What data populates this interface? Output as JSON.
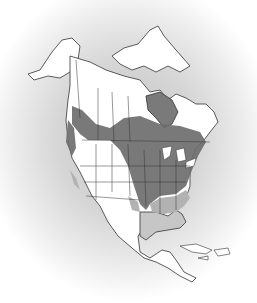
{
  "map": {
    "region": "North America",
    "style": "grayscale range map",
    "colors": {
      "background_halo": "#c8c8c8",
      "land": "#ffffff",
      "outline": "#333333",
      "range_dark": "#6e6e6e",
      "range_light": "#b0b0b0"
    },
    "legend": []
  }
}
